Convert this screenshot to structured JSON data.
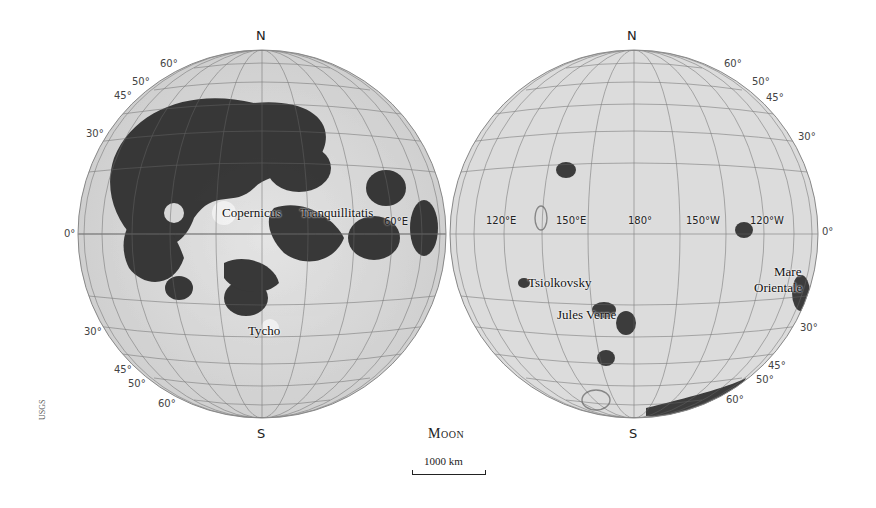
{
  "map": {
    "title": "Moon",
    "credit": "USGS",
    "scale_bar": {
      "label": "1000 km",
      "width_px": 72
    },
    "colors": {
      "highland": "#d6d6d6",
      "mare": "#2a2a2a",
      "grid": "#666666",
      "background": "#ffffff"
    }
  },
  "near_side": {
    "north_label": "N",
    "south_label": "S",
    "lat_labels_north": [
      "60°",
      "50°",
      "45°",
      "30°"
    ],
    "equator_label": "0°",
    "lat_labels_south": [
      "30°",
      "45°",
      "50°",
      "60°"
    ],
    "features": [
      {
        "name": "Copernicus"
      },
      {
        "name": "Tranquillitatis"
      },
      {
        "name": "Tycho"
      }
    ],
    "lon_labels": [
      "60°E"
    ]
  },
  "far_side": {
    "north_label": "N",
    "south_label": "S",
    "lat_labels_north": [
      "60°",
      "50°",
      "45°",
      "30°"
    ],
    "equator_label": "0°",
    "lat_labels_south": [
      "30°",
      "45°",
      "50°",
      "60°"
    ],
    "lon_labels": [
      "120°E",
      "150°E",
      "180°",
      "150°W",
      "120°W"
    ],
    "features": [
      {
        "name": "Tsiolkovsky"
      },
      {
        "name": "Jules Verne"
      },
      {
        "name": "Mare Orientale",
        "line1": "Mare",
        "line2": "Orientale"
      }
    ]
  }
}
